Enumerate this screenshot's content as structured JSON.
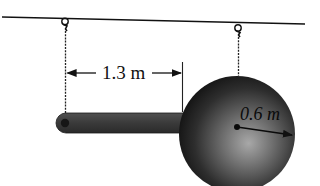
{
  "diagram": {
    "type": "physics-pendulum",
    "labels": {
      "rod_length": "1.3 m",
      "sphere_radius": "0.6 m"
    },
    "components": {
      "ceiling": "ceiling-line",
      "left_support": "hook",
      "right_support": "hook",
      "rod": "slender-rod",
      "sphere": "solid-sphere"
    },
    "colors": {
      "line": "#111111",
      "rod": "#3a3a3a",
      "sphere_dark": "#1a1a1a",
      "sphere_light": "#9a9a9a",
      "background": "#ffffff"
    }
  }
}
